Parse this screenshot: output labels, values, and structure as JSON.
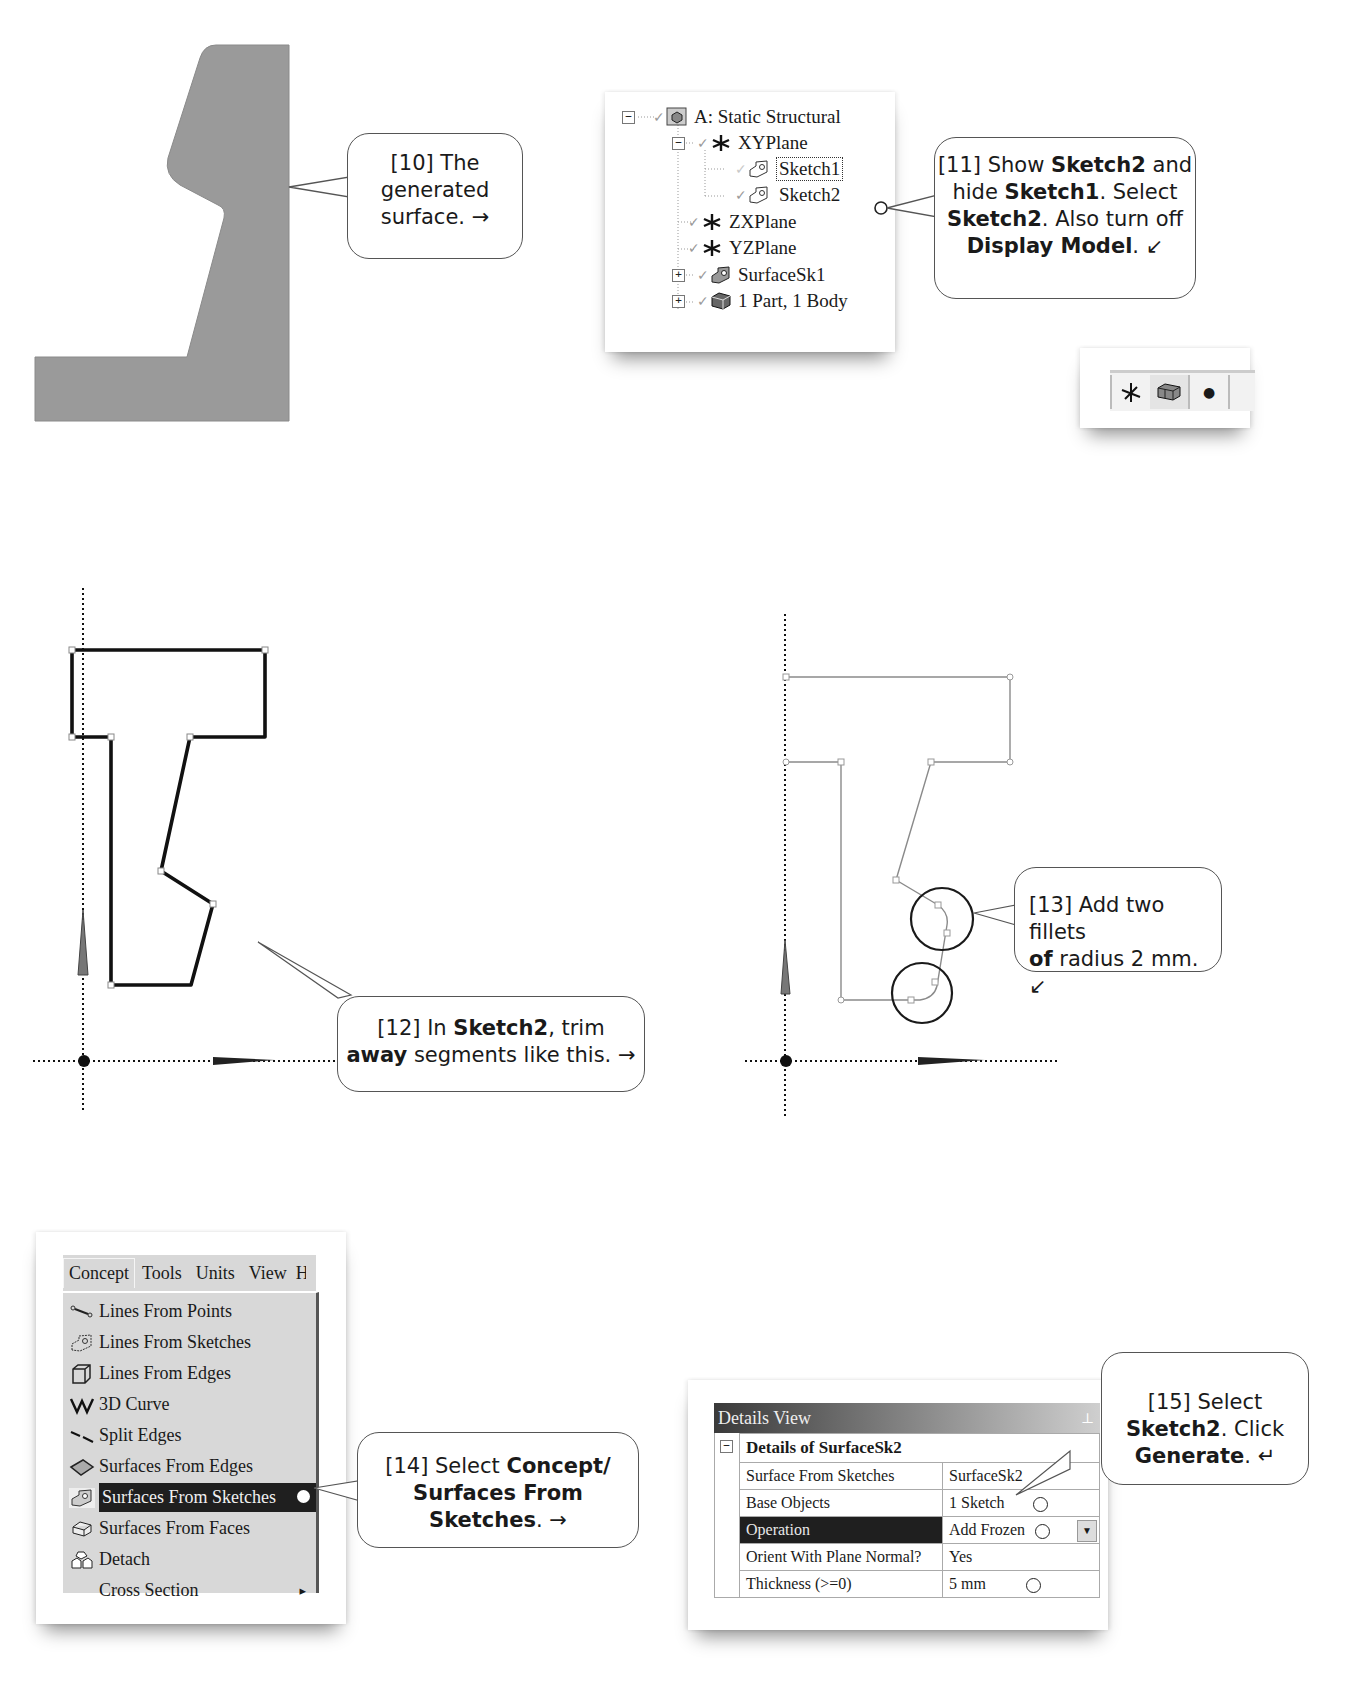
{
  "steps": {
    "s10": {
      "prefix": "[10] The",
      "line2": "generated",
      "line3": "surface.",
      "arrow": "→"
    },
    "s11": {
      "prefix": "[11] Show ",
      "b1": "Sketch2",
      "t1": " and",
      "t2": "hide ",
      "b2": "Sketch1",
      "t3": ". Select",
      "b3": "Sketch2",
      "t4": ". Also turn off",
      "b4": "Display Model",
      "t5": ".",
      "arrow": "↙"
    },
    "s12": {
      "prefix": "[12] In ",
      "b1": "Sketch2",
      "t1": ", trim",
      "b2": "away",
      "t2": " segments like this.",
      "arrow": "→"
    },
    "s13": {
      "prefix": "[13] Add two fillets",
      "b1": "of",
      "t1": " radius 2 mm.",
      "arrow": "↙"
    },
    "s14": {
      "prefix": "[14] Select ",
      "b1": "Concept/",
      "b2": "Surfaces From",
      "b3": "Sketches",
      "t1": ".",
      "arrow": "→"
    },
    "s15": {
      "prefix": "[15] Select",
      "b1": "Sketch2",
      "t1": ".  Click",
      "b2": "Generate",
      "t2": ".",
      "arrow": "↵"
    }
  },
  "tree": {
    "root": "A: Static Structural",
    "items": [
      {
        "label": "XYPlane",
        "toggle": "−"
      },
      {
        "label": "Sketch1"
      },
      {
        "label": "Sketch2"
      },
      {
        "label": "ZXPlane"
      },
      {
        "label": "YZPlane"
      },
      {
        "label": "SurfaceSk1",
        "toggle": "+"
      },
      {
        "label": "1 Part, 1 Body",
        "toggle": "+"
      }
    ],
    "root_toggle": "−"
  },
  "toolbar": {
    "buttons": [
      {
        "name": "display-plane",
        "glyph": "✳"
      },
      {
        "name": "display-model",
        "glyph": "▣"
      },
      {
        "name": "display-point",
        "glyph": "●"
      }
    ]
  },
  "menu": {
    "bar": [
      "Concept",
      "Tools",
      "Units",
      "View",
      "H"
    ],
    "items": [
      {
        "label": "Lines From Points"
      },
      {
        "label": "Lines From Sketches"
      },
      {
        "label": "Lines From Edges"
      },
      {
        "label": "3D Curve"
      },
      {
        "label": "Split Edges"
      },
      {
        "label": "Surfaces From Edges"
      },
      {
        "label": "Surfaces From Sketches",
        "selected": true
      },
      {
        "label": "Surfaces From Faces"
      },
      {
        "label": "Detach"
      },
      {
        "label": "Cross Section",
        "submenu_arrow": "▸"
      }
    ]
  },
  "details": {
    "panel_title": "Details View",
    "pin": "⊥",
    "header": "Details of SurfaceSk2",
    "collapse": "−",
    "rows": [
      {
        "label": "Surface From Sketches",
        "value": "SurfaceSk2"
      },
      {
        "label": "Base Objects",
        "value": "1 Sketch"
      },
      {
        "label": "Operation",
        "value": "Add Frozen",
        "dropdown": "▼"
      },
      {
        "label": "Orient With Plane Normal?",
        "value": "Yes"
      },
      {
        "label": "Thickness (>=0)",
        "value": "5 mm"
      }
    ]
  },
  "colors": {
    "surface_fill": "#9a9a9a",
    "selection": "#1f1f1f",
    "menu_bg": "#d8d8d8"
  }
}
